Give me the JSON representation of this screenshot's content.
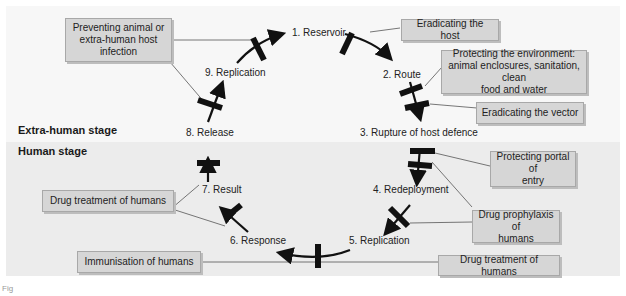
{
  "stages": {
    "extra_human": "Extra-human stage",
    "human": "Human stage"
  },
  "cycle_nodes": [
    {
      "id": "reservoir",
      "label": "1. Reservoir"
    },
    {
      "id": "route",
      "label": "2. Route"
    },
    {
      "id": "rupture",
      "label": "3. Rupture of host defence"
    },
    {
      "id": "redeployment",
      "label": "4. Redeployment"
    },
    {
      "id": "replication5",
      "label": "5. Replication"
    },
    {
      "id": "response",
      "label": "6. Response"
    },
    {
      "id": "result",
      "label": "7. Result"
    },
    {
      "id": "release",
      "label": "8. Release"
    },
    {
      "id": "replication9",
      "label": "9. Replication"
    }
  ],
  "interventions": [
    {
      "id": "preventing-animal",
      "lines": [
        "Preventing animal or",
        "extra-human host",
        "infection"
      ]
    },
    {
      "id": "eradicating-host",
      "lines": [
        "Eradicating the host"
      ]
    },
    {
      "id": "protecting-environment",
      "lines": [
        "Protecting the environment:",
        "animal enclosures, sanitation, clean",
        "food and water"
      ]
    },
    {
      "id": "eradicating-vector",
      "lines": [
        "Eradicating the vector"
      ]
    },
    {
      "id": "protecting-portal",
      "lines": [
        "Protecting portal of",
        "entry"
      ]
    },
    {
      "id": "drug-prophylaxis",
      "lines": [
        "Drug prophylaxis of",
        "humans"
      ]
    },
    {
      "id": "drug-treatment-right",
      "lines": [
        "Drug treatment of humans"
      ]
    },
    {
      "id": "drug-treatment-left",
      "lines": [
        "Drug treatment of humans"
      ]
    },
    {
      "id": "immunisation",
      "lines": [
        "Immunisation of humans"
      ]
    }
  ],
  "colors": {
    "box_fill": "#d6d6d6",
    "extra_human_bg": "#f7f7f7",
    "human_bg": "#ececec",
    "arrow": "#111111"
  },
  "caption": "Fig"
}
